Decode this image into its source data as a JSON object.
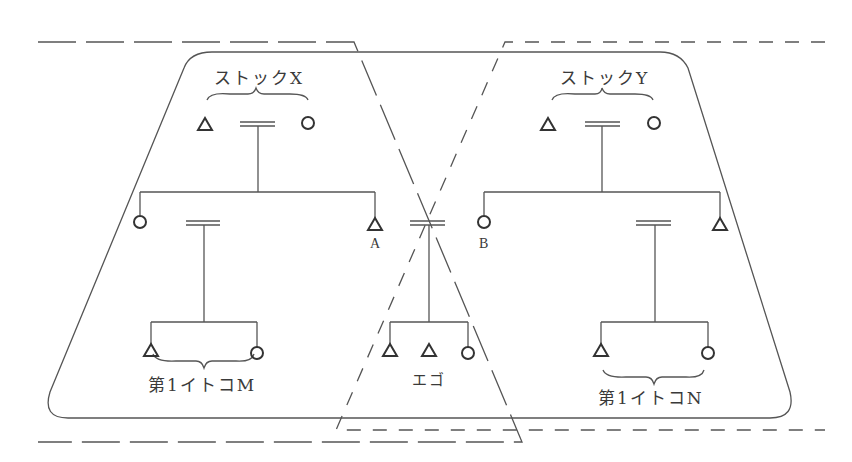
{
  "labels": {
    "stock_x": "ストックX",
    "stock_y": "ストックY",
    "cousin_m": "第1イトコM",
    "cousin_n": "第1イトコN",
    "ego": "エゴ",
    "a": "A",
    "b": "B"
  },
  "symbols": {
    "male": "triangle",
    "female": "circle",
    "marriage": "double-line"
  },
  "colors": {
    "line": "#555555",
    "text": "#3a3a3a",
    "background": "#ffffff"
  }
}
